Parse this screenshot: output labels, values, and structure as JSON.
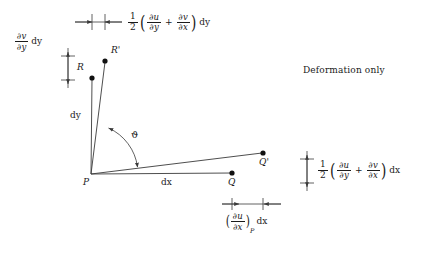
{
  "figure": {
    "title_text": "Deformation only",
    "background_color": "#ffffff",
    "stroke_color": "#3a3a3a",
    "point_color": "#111111"
  },
  "points": [
    {
      "id": "P",
      "label": "P",
      "x": 91,
      "y": 174
    },
    {
      "id": "R",
      "label": "R",
      "x": 92,
      "y": 78
    },
    {
      "id": "Rp",
      "label": "R'",
      "x": 105,
      "y": 61
    },
    {
      "id": "Q",
      "label": "Q",
      "x": 232,
      "y": 173
    },
    {
      "id": "Qp",
      "label": "Q'",
      "x": 263,
      "y": 153
    }
  ],
  "dimension_labels": {
    "dy": "dy",
    "dx": "dx",
    "angle": "ϑ"
  },
  "formulas": {
    "top": {
      "name": "shear-strain-dy",
      "coefficient_num": "1",
      "coefficient_den": "2",
      "term1_num": "∂u",
      "term1_den": "∂y",
      "operator": "+",
      "term2_num": "∂v",
      "term2_den": "∂x",
      "multiplier": "dy",
      "open_paren": "(",
      "close_paren": ")"
    },
    "right": {
      "name": "shear-strain-dx",
      "coefficient_num": "1",
      "coefficient_den": "2",
      "term1_num": "∂u",
      "term1_den": "∂y",
      "operator": "+",
      "term2_num": "∂v",
      "term2_den": "∂x",
      "multiplier": "dx",
      "open_paren": "(",
      "close_paren": ")"
    },
    "bottom": {
      "name": "normal-strain-dx",
      "term_num": "∂u",
      "term_den": "∂x",
      "subscript": "P",
      "multiplier": "dx",
      "open_paren": "(",
      "close_paren": ")"
    },
    "left": {
      "name": "normal-strain-dy",
      "term_num": "∂v",
      "term_den": "∂y",
      "multiplier": "dy"
    }
  }
}
